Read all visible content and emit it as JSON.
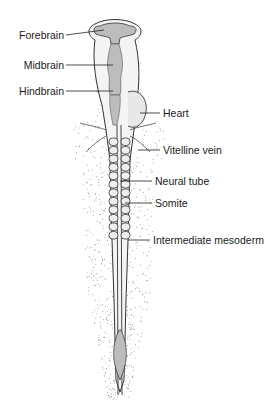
{
  "figure": {
    "title": "",
    "labels": {
      "forebrain": "Forebrain",
      "midbrain": "Midbrain",
      "hindbrain": "Hindbrain",
      "heart": "Heart",
      "vitelline_vein": "Vitelline vein",
      "neural_tube": "Neural tube",
      "somite": "Somite",
      "intermediate_mesoderm": "Intermediate mesoderm"
    },
    "somite_pairs": 12,
    "colors": {
      "outline": "#333333",
      "neural_fill": "#bdbdbd",
      "stipple": "#555555"
    }
  }
}
